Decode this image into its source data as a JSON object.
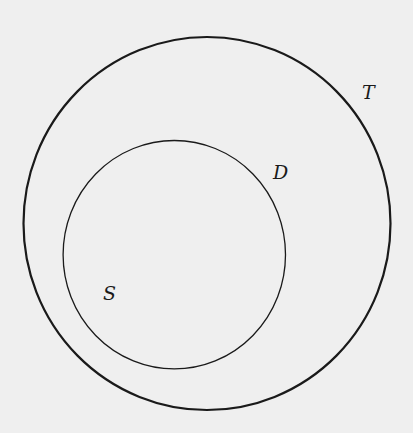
{
  "diagram": {
    "type": "nested-sets",
    "background": "#efefef",
    "stroke_color": "#1a1a1a",
    "sets": [
      {
        "id": "T",
        "label": "T",
        "role": "outer",
        "cx": 207,
        "cy": 223.5,
        "rx": 183.5,
        "ry": 186.5,
        "stroke_width": 2.2,
        "label_x": 362,
        "label_y": 99
      },
      {
        "id": "D",
        "label": "D",
        "role": "inner",
        "cx": 174.3,
        "cy": 254.7,
        "rx": 111.2,
        "ry": 114.2,
        "stroke_width": 1.3,
        "label_x": 273,
        "label_y": 179
      }
    ],
    "points": [
      {
        "id": "S",
        "label": "S",
        "inside": "D",
        "label_x": 103,
        "label_y": 300
      }
    ]
  }
}
